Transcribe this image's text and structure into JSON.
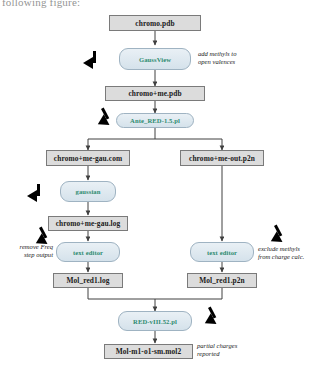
{
  "document": {
    "surrounding_text": "following figure:"
  },
  "diagram": {
    "colors": {
      "file_node_fill": "#dcdcdc",
      "file_node_border": "#7a7a7a",
      "process_node_fill": "#dfe8ef",
      "process_node_border": "#9fb3c2",
      "process_node_text": "#2e8b70",
      "connector": "#404040",
      "cursor": "#000000",
      "background": "#ffffff"
    },
    "nodes": [
      {
        "id": "n1",
        "type": "file",
        "label": "chromo.pdb"
      },
      {
        "id": "n2",
        "type": "process",
        "label": "GaussView"
      },
      {
        "id": "n3",
        "type": "file",
        "label": "chromo+me.pdb"
      },
      {
        "id": "n4",
        "type": "process",
        "label": "Ante_RED-1.5.pl"
      },
      {
        "id": "n5",
        "type": "file",
        "label": "chromo+me-gau.com"
      },
      {
        "id": "n6",
        "type": "file",
        "label": "chromo+me-out.p2n"
      },
      {
        "id": "n7",
        "type": "process",
        "label": "gaussian"
      },
      {
        "id": "n8",
        "type": "file",
        "label": "chromo+me-gau.log"
      },
      {
        "id": "n9",
        "type": "process",
        "label": "text editor"
      },
      {
        "id": "n10",
        "type": "process",
        "label": "text editor"
      },
      {
        "id": "n11",
        "type": "file",
        "label": "Mol_red1.log"
      },
      {
        "id": "n12",
        "type": "file",
        "label": "Mol_red1.p2n"
      },
      {
        "id": "n13",
        "type": "process",
        "label": "RED-vIII.52.pl"
      },
      {
        "id": "n14",
        "type": "file",
        "label": "Mol-m1-o1-sm.mol2"
      }
    ],
    "annotations": [
      {
        "id": "a1",
        "text": "add methyls to\nopen valences",
        "side": "right",
        "for": "n2"
      },
      {
        "id": "a2",
        "text": "remove Freq\nstep output",
        "side": "left",
        "for": "n9"
      },
      {
        "id": "a3",
        "text": "exclude methyls\nfrom charge calc.",
        "side": "right",
        "for": "n10"
      },
      {
        "id": "a4",
        "text": "partial charges\nreported",
        "side": "right",
        "for": "n14"
      }
    ],
    "cursors": [
      {
        "id": "c1",
        "points_to": "n2"
      },
      {
        "id": "c2",
        "points_to": "n4"
      },
      {
        "id": "c3",
        "points_to": "n7"
      },
      {
        "id": "c4",
        "points_to": "n9"
      },
      {
        "id": "c5",
        "points_to": "n10"
      },
      {
        "id": "c6",
        "points_to": "n13"
      }
    ]
  }
}
